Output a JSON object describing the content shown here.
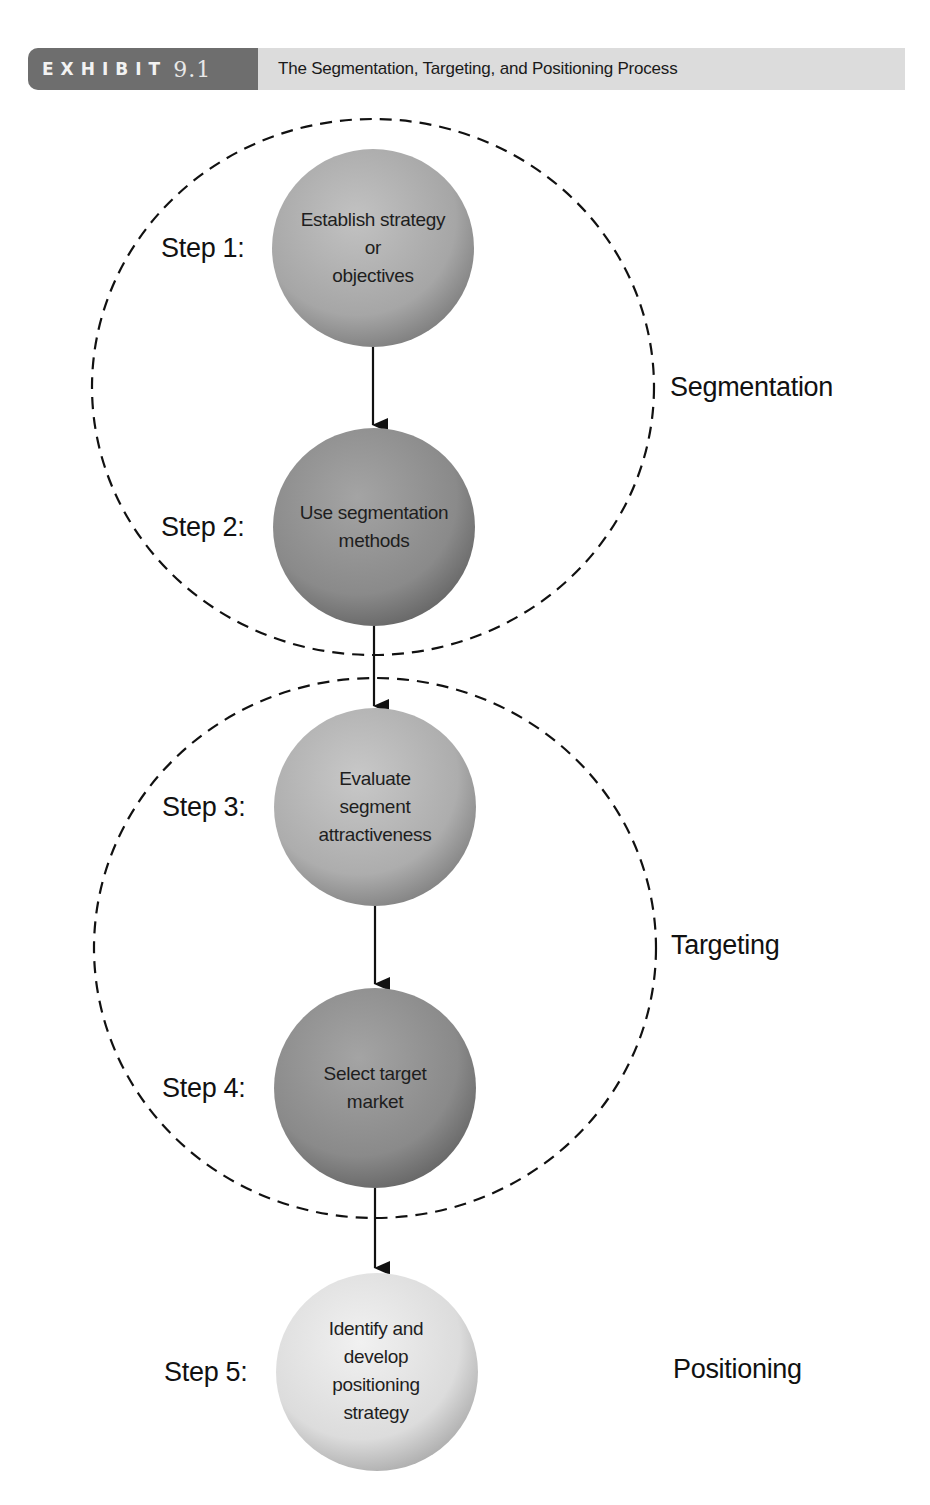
{
  "header": {
    "exhibit_word": "EXHIBIT",
    "exhibit_number": "9.1",
    "title": "The Segmentation, Targeting, and Positioning Process"
  },
  "steps": [
    {
      "label": "Step 1:",
      "text_lines": [
        "Establish strategy",
        "or",
        "objectives"
      ],
      "fill": "#a9a9a9"
    },
    {
      "label": "Step 2:",
      "text_lines": [
        "Use segmentation",
        "methods"
      ],
      "fill": "#8e8e8e"
    },
    {
      "label": "Step 3:",
      "text_lines": [
        "Evaluate",
        "segment",
        "attractiveness"
      ],
      "fill": "#b0b0b0"
    },
    {
      "label": "Step 4:",
      "text_lines": [
        "Select target",
        "market"
      ],
      "fill": "#8e8e8e"
    },
    {
      "label": "Step 5:",
      "text_lines": [
        "Identify and",
        "develop",
        "positioning",
        "strategy"
      ],
      "fill": "#dedede"
    }
  ],
  "phases": [
    {
      "label": "Segmentation",
      "steps": [
        1,
        2
      ]
    },
    {
      "label": "Targeting",
      "steps": [
        3,
        4
      ]
    },
    {
      "label": "Positioning",
      "steps": [
        5
      ]
    }
  ],
  "colors": {
    "header_dark": "#6e6e6e",
    "header_light": "#dcdcdc",
    "line": "#111111"
  }
}
